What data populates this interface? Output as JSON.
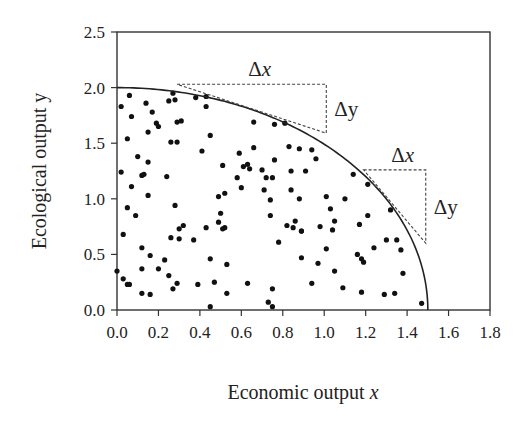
{
  "chart_data": {
    "type": "scatter",
    "title": "",
    "xlabel": "Economic output x",
    "xlabel_main": "Economic output ",
    "xlabel_var": "x",
    "ylabel": "Ecological output y",
    "xlim": [
      0,
      1.8
    ],
    "ylim": [
      0,
      2.5
    ],
    "xticks": [
      "0.0",
      "0.2",
      "0.4",
      "0.6",
      "0.8",
      "1.0",
      "1.2",
      "1.4",
      "1.6",
      "1.8"
    ],
    "yticks": [
      "0.0",
      "0.5",
      "1.0",
      "1.5",
      "2.0",
      "2.5"
    ],
    "grid": false,
    "legend": null,
    "frontier_curve": {
      "shape": "quarter-ellipse",
      "x_intercept": 1.5,
      "y_intercept": 2.0,
      "equation": "(x/1.5)^2 + (y/2.0)^2 = 1"
    },
    "annotations": [
      {
        "label_dx": "Δx",
        "label_dy": "Δy",
        "triangle": {
          "x0": 0.29,
          "y0": 2.03,
          "x1": 1.01,
          "y1": 1.59
        }
      },
      {
        "label_dx": "Δx",
        "label_dy": "Δy",
        "triangle": {
          "x0": 1.19,
          "y0": 1.26,
          "x1": 1.49,
          "y1": 0.6
        }
      }
    ],
    "points": [
      [
        0.06,
        1.93
      ],
      [
        0.02,
        1.83
      ],
      [
        0.14,
        1.86
      ],
      [
        0.27,
        1.95
      ],
      [
        0.25,
        1.88
      ],
      [
        0.28,
        1.89
      ],
      [
        0.38,
        1.91
      ],
      [
        0.43,
        1.92
      ],
      [
        0.43,
        1.83
      ],
      [
        0.17,
        1.78
      ],
      [
        0.07,
        1.74
      ],
      [
        0.19,
        1.68
      ],
      [
        0.2,
        1.65
      ],
      [
        0.15,
        1.6
      ],
      [
        0.29,
        1.69
      ],
      [
        0.31,
        1.7
      ],
      [
        0.66,
        1.69
      ],
      [
        0.76,
        1.67
      ],
      [
        0.81,
        1.68
      ],
      [
        0.05,
        1.54
      ],
      [
        0.26,
        1.51
      ],
      [
        0.29,
        1.51
      ],
      [
        0.45,
        1.57
      ],
      [
        0.41,
        1.43
      ],
      [
        0.66,
        1.46
      ],
      [
        0.59,
        1.41
      ],
      [
        0.83,
        1.47
      ],
      [
        0.88,
        1.45
      ],
      [
        0.1,
        1.38
      ],
      [
        0.15,
        1.33
      ],
      [
        0.76,
        1.35
      ],
      [
        0.02,
        1.24
      ],
      [
        0.12,
        1.21
      ],
      [
        0.13,
        1.22
      ],
      [
        0.24,
        1.2
      ],
      [
        0.51,
        1.3
      ],
      [
        0.61,
        1.29
      ],
      [
        0.63,
        1.31
      ],
      [
        0.64,
        1.27
      ],
      [
        0.7,
        1.26
      ],
      [
        0.72,
        1.19
      ],
      [
        0.75,
        1.19
      ],
      [
        0.84,
        1.25
      ],
      [
        0.91,
        1.25
      ],
      [
        0.58,
        1.19
      ],
      [
        0.07,
        1.11
      ],
      [
        0.6,
        1.1
      ],
      [
        0.71,
        1.08
      ],
      [
        0.84,
        1.08
      ],
      [
        0.15,
        1.03
      ],
      [
        0.49,
        1.02
      ],
      [
        0.52,
        1.05
      ],
      [
        0.74,
        0.99
      ],
      [
        0.88,
        1.0
      ],
      [
        0.05,
        0.92
      ],
      [
        0.09,
        0.85
      ],
      [
        0.28,
        0.94
      ],
      [
        0.5,
        0.87
      ],
      [
        0.49,
        0.79
      ],
      [
        0.52,
        0.74
      ],
      [
        0.51,
        0.73
      ],
      [
        0.74,
        0.85
      ],
      [
        0.82,
        0.76
      ],
      [
        0.86,
        0.8
      ],
      [
        0.85,
        0.74
      ],
      [
        0.89,
        0.71
      ],
      [
        0.03,
        0.68
      ],
      [
        0.32,
        0.76
      ],
      [
        0.3,
        0.73
      ],
      [
        0.43,
        0.74
      ],
      [
        0.26,
        0.65
      ],
      [
        0.3,
        0.64
      ],
      [
        0.37,
        0.63
      ],
      [
        0.78,
        0.61
      ],
      [
        0.12,
        0.56
      ],
      [
        0.16,
        0.49
      ],
      [
        0.23,
        0.45
      ],
      [
        0.45,
        0.46
      ],
      [
        0.53,
        0.41
      ],
      [
        0.89,
        0.47
      ],
      [
        0.0,
        0.35
      ],
      [
        0.12,
        0.37
      ],
      [
        0.2,
        0.37
      ],
      [
        0.25,
        0.31
      ],
      [
        0.03,
        0.28
      ],
      [
        0.05,
        0.23
      ],
      [
        0.06,
        0.23
      ],
      [
        0.29,
        0.24
      ],
      [
        0.27,
        0.19
      ],
      [
        0.39,
        0.23
      ],
      [
        0.47,
        0.25
      ],
      [
        0.63,
        0.24
      ],
      [
        0.75,
        0.19
      ],
      [
        0.12,
        0.15
      ],
      [
        0.16,
        0.14
      ],
      [
        0.53,
        0.15
      ],
      [
        0.73,
        0.07
      ],
      [
        0.45,
        0.03
      ],
      [
        0.75,
        0.03
      ],
      [
        0.94,
        1.44
      ],
      [
        0.96,
        1.36
      ],
      [
        1.14,
        1.22
      ],
      [
        1.21,
        1.13
      ],
      [
        1.01,
        1.02
      ],
      [
        1.1,
        1.0
      ],
      [
        1.03,
        0.91
      ],
      [
        1.21,
        0.85
      ],
      [
        1.32,
        0.9
      ],
      [
        1.05,
        0.8
      ],
      [
        1.17,
        0.77
      ],
      [
        0.89,
        0.71
      ],
      [
        0.98,
        0.75
      ],
      [
        1.04,
        0.72
      ],
      [
        1.3,
        0.63
      ],
      [
        1.35,
        0.63
      ],
      [
        1.01,
        0.55
      ],
      [
        1.24,
        0.56
      ],
      [
        1.37,
        0.54
      ],
      [
        0.97,
        0.42
      ],
      [
        1.16,
        0.5
      ],
      [
        1.18,
        0.46
      ],
      [
        1.19,
        0.43
      ],
      [
        1.05,
        0.35
      ],
      [
        1.38,
        0.33
      ],
      [
        0.94,
        0.24
      ],
      [
        1.09,
        0.2
      ],
      [
        1.18,
        0.16
      ],
      [
        1.29,
        0.14
      ],
      [
        1.34,
        0.15
      ],
      [
        1.47,
        0.06
      ]
    ]
  }
}
